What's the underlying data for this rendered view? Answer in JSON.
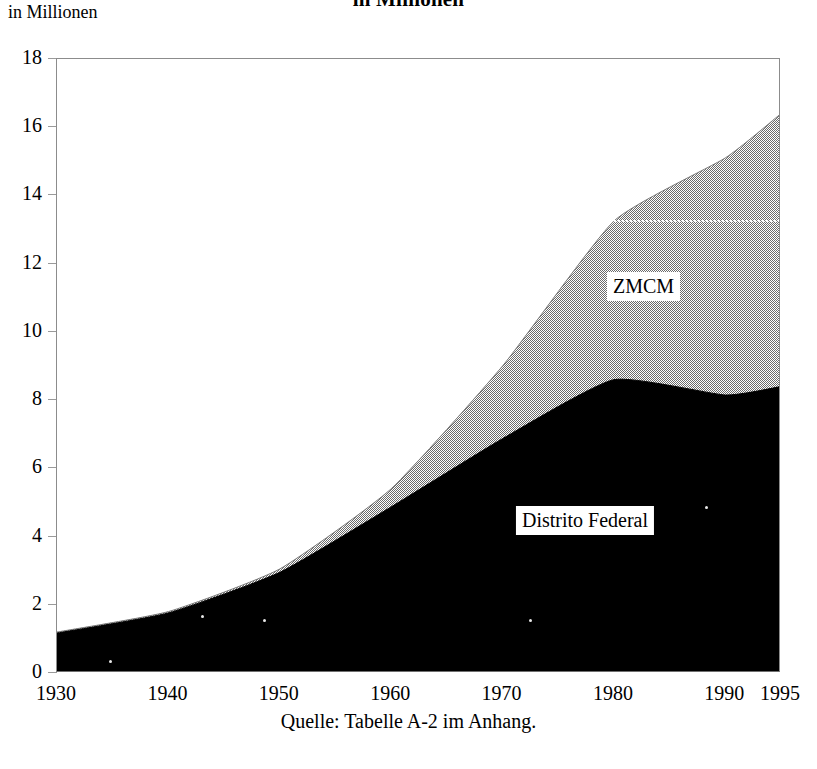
{
  "title": "in Millionen",
  "y_axis_caption": "in Millionen",
  "source_note": "Quelle: Tabelle A-2 im Anhang.",
  "labels": {
    "zmcm": "ZMCM",
    "distrito_federal": "Distrito Federal"
  },
  "colors": {
    "distrito_federal": "#000000",
    "zmcm": "#9a9a9a",
    "axis": "#8c8c8c",
    "background": "#ffffff"
  },
  "chart_data": {
    "type": "area",
    "title": "in Millionen",
    "subtitle": "",
    "xlabel": "",
    "ylabel": "in Millionen",
    "xlim": [
      1930,
      1995
    ],
    "ylim": [
      0,
      18
    ],
    "yticks": [
      0,
      2,
      4,
      6,
      8,
      10,
      12,
      14,
      16,
      18
    ],
    "xticks": [
      1930,
      1940,
      1950,
      1960,
      1970,
      1980,
      1990,
      1995
    ],
    "grid": false,
    "legend_position": "inline-annotations",
    "stacked": false,
    "x": [
      1930,
      1940,
      1950,
      1960,
      1970,
      1980,
      1990,
      1995
    ],
    "series": [
      {
        "name": "ZMCM",
        "color": "#9a9a9a",
        "fill": "gray-checker",
        "values": [
          1.2,
          1.8,
          3.05,
          5.4,
          9.0,
          13.25,
          15.1,
          16.4
        ]
      },
      {
        "name": "Distrito Federal",
        "color": "#000000",
        "fill": "solid-black",
        "values": [
          1.17,
          1.76,
          2.95,
          4.87,
          6.87,
          8.6,
          8.15,
          8.4
        ]
      }
    ],
    "annotations": [
      {
        "text": "ZMCM",
        "x": 1980.6,
        "y": 11.2
      },
      {
        "text": "Distrito Federal",
        "x": 1977.0,
        "y": 4.8
      },
      {
        "text": "dotted-reference-line",
        "x_from": 1980,
        "x_to": 1995,
        "y": 13.25
      }
    ]
  },
  "y_ticks": [
    {
      "label": "18",
      "value": 18
    },
    {
      "label": "16",
      "value": 16
    },
    {
      "label": "14",
      "value": 14
    },
    {
      "label": "12",
      "value": 12
    },
    {
      "label": "10",
      "value": 10
    },
    {
      "label": "8",
      "value": 8
    },
    {
      "label": "6",
      "value": 6
    },
    {
      "label": "4",
      "value": 4
    },
    {
      "label": "2",
      "value": 2
    },
    {
      "label": "0",
      "value": 0
    }
  ],
  "x_ticks": [
    {
      "label": "1930",
      "value": 1930
    },
    {
      "label": "1940",
      "value": 1940
    },
    {
      "label": "1950",
      "value": 1950
    },
    {
      "label": "1960",
      "value": 1960
    },
    {
      "label": "1970",
      "value": 1970
    },
    {
      "label": "1980",
      "value": 1980
    },
    {
      "label": "1990",
      "value": 1990
    },
    {
      "label": "1995",
      "value": 1995
    }
  ]
}
